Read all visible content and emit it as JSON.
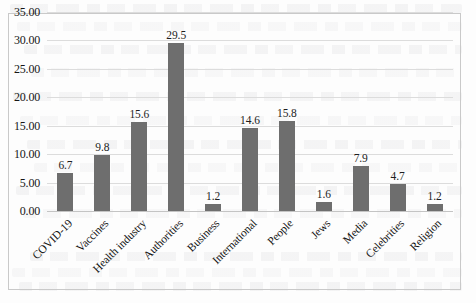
{
  "chart_data": {
    "type": "bar",
    "title": "",
    "subtitle": "",
    "xlabel": "",
    "ylabel": "",
    "categories": [
      "COVID-19",
      "Vaccines",
      "Health industry",
      "Authorities",
      "Business",
      "International",
      "People",
      "Jews",
      "Media",
      "Celebrities",
      "Religion"
    ],
    "values": [
      6.7,
      9.8,
      15.6,
      29.5,
      1.2,
      14.6,
      15.8,
      1.6,
      7.9,
      4.7,
      1.2
    ],
    "value_labels": [
      "6.7",
      "9.8",
      "15.6",
      "29.5",
      "1.2",
      "14.6",
      "15.8",
      "1.6",
      "7.9",
      "4.7",
      "1.2"
    ],
    "ylim": [
      0,
      35
    ],
    "y_ticks": [
      0,
      5,
      10,
      15,
      20,
      25,
      30,
      35
    ],
    "y_tick_labels": [
      "0.00",
      "5.00",
      "10.00",
      "15.00",
      "20.00",
      "25.00",
      "30.00",
      "35.00"
    ],
    "grid": true,
    "grid_axis": "y",
    "legend": false,
    "legend_position": "none",
    "bar_color": "#6e6e6e",
    "grid_color": "#dcdcdc",
    "frame_color": "#c9c9c9",
    "text_color": "#111111",
    "x_label_rotation_deg": -45,
    "series": [
      {
        "name": "",
        "values": [
          6.7,
          9.8,
          15.6,
          29.5,
          1.2,
          14.6,
          15.8,
          1.6,
          7.9,
          4.7,
          1.2
        ]
      }
    ]
  }
}
